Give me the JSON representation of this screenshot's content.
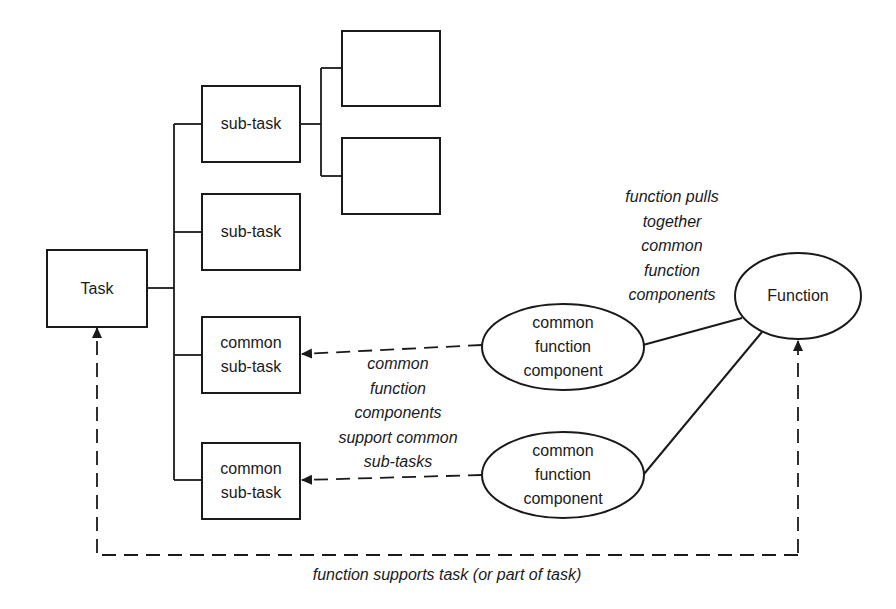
{
  "diagram": {
    "task": {
      "label": "Task"
    },
    "subtasks": [
      {
        "label": "sub-task"
      },
      {
        "label": "sub-task"
      },
      {
        "lines": [
          "common",
          "sub-task"
        ]
      },
      {
        "lines": [
          "common",
          "sub-task"
        ]
      }
    ],
    "child_boxes": [
      {
        "label": ""
      },
      {
        "label": ""
      }
    ],
    "components": [
      {
        "lines": [
          "common",
          "function",
          "component"
        ]
      },
      {
        "lines": [
          "common",
          "function",
          "component"
        ]
      }
    ],
    "function": {
      "label": "Function"
    },
    "annotations": {
      "pulls_together": [
        "function pulls",
        "together",
        "common",
        "function",
        "components"
      ],
      "support_common": [
        "common",
        "function",
        "components",
        "support common",
        "sub-tasks"
      ],
      "supports_task": "function supports task (or part of task)"
    },
    "colors": {
      "stroke": "#1a1a1a",
      "background": "#ffffff"
    }
  }
}
